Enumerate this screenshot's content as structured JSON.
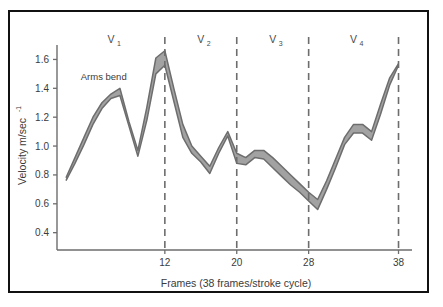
{
  "chart_data": {
    "type": "line",
    "title": "",
    "xlabel": "Frames (38 frames/stroke cycle)",
    "ylabel": "Velocity m/sec",
    "ylabel_superscript": "-1",
    "xlim": [
      0,
      39.5
    ],
    "ylim": [
      0.28,
      1.7
    ],
    "grid": false,
    "legend": false,
    "x_ticks": [
      12,
      20,
      28,
      38
    ],
    "x_tick_labels": [
      "12",
      "20",
      "28",
      "38"
    ],
    "y_ticks": [
      0.4,
      0.6,
      0.8,
      1.0,
      1.2,
      1.4,
      1.6
    ],
    "y_tick_labels": [
      "0.4",
      "0.6",
      "0.8",
      "1.0",
      "1.2",
      "1.4",
      "1.6"
    ],
    "x": [
      1,
      2,
      3,
      4,
      5,
      6,
      7,
      8,
      9,
      10,
      11,
      12,
      13,
      14,
      15,
      16,
      17,
      18,
      19,
      20,
      21,
      22,
      23,
      24,
      25,
      26,
      27,
      28,
      29,
      30,
      31,
      32,
      33,
      34,
      35,
      36,
      37,
      38
    ],
    "series": [
      {
        "name": "upper bound",
        "values": [
          0.78,
          0.92,
          1.06,
          1.2,
          1.3,
          1.36,
          1.4,
          1.17,
          0.97,
          1.27,
          1.61,
          1.66,
          1.4,
          1.15,
          1.0,
          0.93,
          0.86,
          0.99,
          1.1,
          0.95,
          0.92,
          0.97,
          0.97,
          0.92,
          0.86,
          0.8,
          0.74,
          0.68,
          0.63,
          0.76,
          0.91,
          1.06,
          1.15,
          1.15,
          1.1,
          1.29,
          1.47,
          1.57
        ]
      },
      {
        "name": "lower bound",
        "values": [
          0.76,
          0.88,
          1.01,
          1.15,
          1.26,
          1.33,
          1.35,
          1.14,
          0.93,
          1.18,
          1.5,
          1.56,
          1.31,
          1.06,
          0.95,
          0.89,
          0.81,
          0.95,
          1.07,
          0.88,
          0.87,
          0.92,
          0.91,
          0.85,
          0.79,
          0.73,
          0.68,
          0.62,
          0.56,
          0.7,
          0.85,
          1.01,
          1.09,
          1.09,
          1.04,
          1.22,
          1.42,
          1.56
        ]
      }
    ],
    "phase_markers": [
      {
        "label": "V",
        "subscript": "1",
        "x_position": 6.0
      },
      {
        "label": "V",
        "subscript": "2",
        "x_position": 16.0
      },
      {
        "label": "V",
        "subscript": "3",
        "x_position": 24.0
      },
      {
        "label": "V",
        "subscript": "4",
        "x_position": 33.0
      }
    ],
    "divider_lines": [
      12,
      20,
      28,
      38
    ],
    "annotations": [
      {
        "text": "Arms bend",
        "x_position": 5.2,
        "y_position": 1.46
      }
    ],
    "colors": {
      "band_fill": "#9a9a9a",
      "band_fill_light": "#c8c8c8",
      "line_stroke": "#6d6d6d",
      "axis": "#6d6d6d",
      "divider": "#6d6d6d",
      "text": "#3b3b3b",
      "frame_border": "#111111",
      "background": "#ffffff"
    }
  }
}
